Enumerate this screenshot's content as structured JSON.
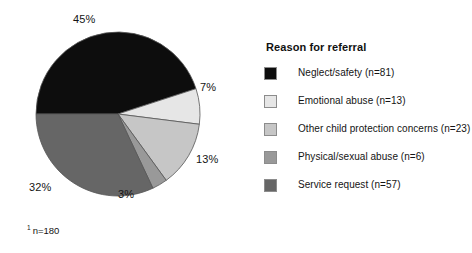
{
  "chart_data": {
    "type": "pie",
    "title": "",
    "legend_title": "Reason for referral",
    "legend_position": "right",
    "total_n": 180,
    "footnote": "n=180",
    "footnote_marker": "1",
    "start_angle_deg": 180,
    "direction": "clockwise",
    "categories": [
      "Neglect/safety",
      "Emotional abuse",
      "Other child protection concerns",
      "Physical/sexual abuse",
      "Service request"
    ],
    "values": [
      45,
      7,
      13,
      3,
      32
    ],
    "counts": [
      81,
      13,
      23,
      6,
      57
    ],
    "colors": [
      "#0d0d0d",
      "#e6e6e6",
      "#c6c6c6",
      "#999999",
      "#666666"
    ],
    "slices": [
      {
        "label": "Neglect/safety",
        "percent": 45,
        "percent_label": "45%",
        "count": 81,
        "legend_label": "Neglect/safety (n=81)",
        "color": "#0d0d0d"
      },
      {
        "label": "Emotional abuse",
        "percent": 7,
        "percent_label": "7%",
        "count": 13,
        "legend_label": "Emotional abuse (n=13)",
        "color": "#e6e6e6"
      },
      {
        "label": "Other child protection concerns",
        "percent": 13,
        "percent_label": "13%",
        "count": 23,
        "legend_label": "Other child protection concerns (n=23)",
        "color": "#c6c6c6"
      },
      {
        "label": "Physical/sexual abuse",
        "percent": 3,
        "percent_label": "3%",
        "count": 6,
        "legend_label": "Physical/sexual abuse (n=6)",
        "color": "#999999"
      },
      {
        "label": "Service request",
        "percent": 32,
        "percent_label": "32%",
        "count": 57,
        "legend_label": "Service request (n=57)",
        "color": "#666666"
      }
    ]
  },
  "pie": {
    "center_x": 118,
    "center_y": 114,
    "radius": 82,
    "outline_color": "#555555",
    "labels": {
      "neglect": "45%",
      "emotional": "7%",
      "other": "13%",
      "physical": "3%",
      "service": "32%"
    }
  },
  "legend": {
    "title": "Reason for referral",
    "items": [
      {
        "label": "Neglect/safety (n=81)",
        "color": "#0d0d0d"
      },
      {
        "label": "Emotional abuse (n=13)",
        "color": "#e6e6e6"
      },
      {
        "label": "Other child protection concerns (n=23)",
        "color": "#c6c6c6"
      },
      {
        "label": "Physical/sexual abuse (n=6)",
        "color": "#999999"
      },
      {
        "label": "Service request (n=57)",
        "color": "#666666"
      }
    ]
  },
  "footnote": {
    "marker": "1",
    "text": "n=180"
  }
}
